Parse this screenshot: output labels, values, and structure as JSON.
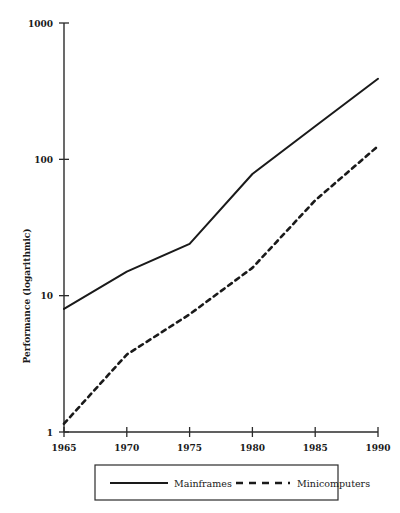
{
  "chart_data": {
    "type": "line",
    "title": "",
    "xlabel": "",
    "ylabel": "Performance (logarithmic)",
    "x": [
      1965,
      1970,
      1975,
      1980,
      1985,
      1990
    ],
    "xtick_labels": [
      "1965",
      "1970",
      "1975",
      "1980",
      "1985",
      "1990"
    ],
    "xlim": [
      1965,
      1990
    ],
    "ylim": [
      1,
      1000
    ],
    "yscale": "log",
    "ytick_labels": [
      "1",
      "10",
      "100",
      "1000"
    ],
    "ytick_values": [
      1,
      10,
      100,
      1000
    ],
    "grid": false,
    "legend_position": "bottom",
    "series": [
      {
        "name": "Mainframes",
        "style": "solid",
        "color": "#1a1a1a",
        "values": [
          8.0,
          15.0,
          24.0,
          78.0,
          175.0,
          390.0
        ]
      },
      {
        "name": "Minicomputers",
        "style": "dashed",
        "color": "#1a1a1a",
        "values": [
          1.15,
          3.7,
          7.3,
          16.0,
          50.0,
          125.0
        ]
      }
    ]
  },
  "legend": {
    "entries": [
      {
        "label": "Mainframes",
        "style": "solid"
      },
      {
        "label": "Minicomputers",
        "style": "dashed"
      }
    ]
  },
  "axes": {
    "y_title": "Performance (logarithmic)"
  }
}
